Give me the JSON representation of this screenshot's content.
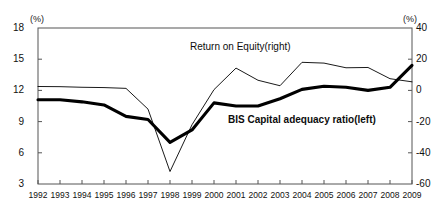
{
  "axes": {
    "left_unit": "(%)",
    "right_unit": "(%)",
    "left_ticks": [
      "18",
      "15",
      "12",
      "9",
      "6",
      "3"
    ],
    "right_ticks": [
      "40",
      "20",
      "0",
      "-20",
      "-40",
      "-60"
    ],
    "left_range": [
      3,
      18
    ],
    "right_range": [
      -60,
      40
    ],
    "x_ticks": [
      "1992",
      "1993",
      "1994",
      "1995",
      "1996",
      "1997",
      "1998",
      "1999",
      "2000",
      "2001",
      "2002",
      "2003",
      "2004",
      "2005",
      "2006",
      "2007",
      "2008",
      "2009"
    ]
  },
  "labels": {
    "roe": "Return on Equity(right)",
    "bis": "BIS Capital adequacy ratio(left)"
  },
  "colors": {
    "line": "#000000",
    "axis": "#555555",
    "background": "#ffffff"
  },
  "chart_data": {
    "type": "line",
    "title": "",
    "xlabel": "",
    "ylabel": "",
    "x": [
      "1992",
      "1993",
      "1994",
      "1995",
      "1996",
      "1997",
      "1998",
      "1999",
      "2000",
      "2001",
      "2002",
      "2003",
      "2004",
      "2005",
      "2006",
      "2007",
      "2008",
      "2009"
    ],
    "ylim": [
      3,
      18
    ],
    "ylim_right": [
      -60,
      40
    ],
    "grid": false,
    "legend": "inline-annotation",
    "series": [
      {
        "name": "BIS Capital adequacy ratio(left)",
        "axis": "left",
        "style": "thick",
        "values": [
          11.1,
          11.1,
          10.9,
          10.6,
          9.5,
          9.2,
          7.0,
          8.2,
          10.8,
          10.5,
          10.5,
          11.2,
          12.1,
          12.4,
          12.3,
          12.0,
          12.3,
          14.4
        ]
      },
      {
        "name": "Return on Equity(right)",
        "axis": "right",
        "style": "thin",
        "values": [
          2.5,
          2.4,
          2.0,
          1.8,
          1.3,
          -12,
          -52,
          -22,
          0.5,
          14.3,
          6.5,
          3.0,
          18.0,
          17.5,
          14.5,
          14.7,
          7.5,
          5.5
        ]
      }
    ]
  }
}
